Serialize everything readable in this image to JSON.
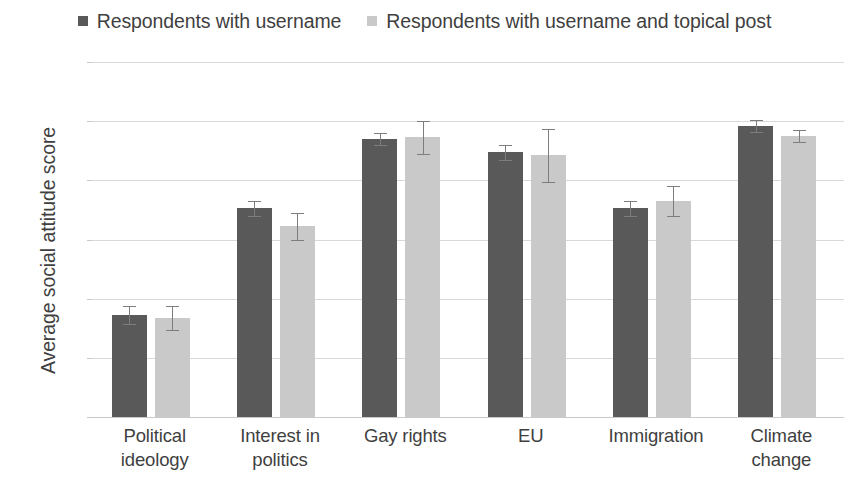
{
  "chart_data": {
    "type": "bar",
    "title": "",
    "subtitle": "",
    "xlabel": "",
    "ylabel": "Average social attitude score",
    "ylim": [
      0,
      12
    ],
    "yticks": [
      "0",
      "2",
      "4",
      "6",
      "8",
      "10",
      "12"
    ],
    "grid": true,
    "legend_position": "top-center",
    "error_bars": "standard error / 95% CI",
    "categories": [
      "Political ideology",
      "Interest in politics",
      "Gay rights",
      "EU",
      "Immigration",
      "Climate change"
    ],
    "category_lines": [
      [
        "Political",
        "ideology"
      ],
      [
        "Interest in",
        "politics"
      ],
      [
        "Gay rights",
        ""
      ],
      [
        "EU",
        ""
      ],
      [
        "Immigration",
        ""
      ],
      [
        "Climate",
        "change"
      ]
    ],
    "series": [
      {
        "name": "Respondents with username",
        "color": "#595959",
        "values": [
          3.45,
          7.05,
          9.4,
          8.95,
          7.05,
          9.85
        ],
        "errors": [
          0.3,
          0.25,
          0.2,
          0.25,
          0.25,
          0.2
        ]
      },
      {
        "name": "Respondents with username and topical post",
        "color": "#c9c9c9",
        "values": [
          3.35,
          6.45,
          9.45,
          8.85,
          7.3,
          9.5
        ],
        "errors": [
          0.4,
          0.45,
          0.55,
          0.9,
          0.5,
          0.2
        ]
      }
    ]
  },
  "legend": {
    "entries": [
      {
        "label": "Respondents with username",
        "color": "#595959"
      },
      {
        "label": "Respondents with username and topical post",
        "color": "#c9c9c9"
      }
    ]
  },
  "axes": {
    "y_title": "Average social attitude score"
  }
}
